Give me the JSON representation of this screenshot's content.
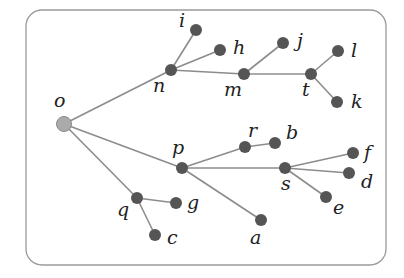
{
  "diagram": {
    "type": "tree",
    "root": "o",
    "nodes": [
      {
        "id": "o",
        "label": "o",
        "x": 64,
        "y": 124,
        "lx": 54,
        "ly": 107,
        "root": true
      },
      {
        "id": "n",
        "label": "n",
        "x": 171,
        "y": 70,
        "lx": 153,
        "ly": 92
      },
      {
        "id": "i",
        "label": "i",
        "x": 196,
        "y": 30,
        "lx": 179,
        "ly": 27
      },
      {
        "id": "h",
        "label": "h",
        "x": 220,
        "y": 50,
        "lx": 233,
        "ly": 54
      },
      {
        "id": "m",
        "label": "m",
        "x": 244,
        "y": 74,
        "lx": 224,
        "ly": 96
      },
      {
        "id": "j",
        "label": "j",
        "x": 283,
        "y": 43,
        "lx": 297,
        "ly": 47
      },
      {
        "id": "t",
        "label": "t",
        "x": 311,
        "y": 74,
        "lx": 302,
        "ly": 96
      },
      {
        "id": "l",
        "label": "l",
        "x": 338,
        "y": 51,
        "lx": 351,
        "ly": 57
      },
      {
        "id": "k",
        "label": "k",
        "x": 337,
        "y": 102,
        "lx": 351,
        "ly": 108
      },
      {
        "id": "p",
        "label": "p",
        "x": 182,
        "y": 168,
        "lx": 172,
        "ly": 154
      },
      {
        "id": "r",
        "label": "r",
        "x": 245,
        "y": 147,
        "lx": 248,
        "ly": 137
      },
      {
        "id": "b",
        "label": "b",
        "x": 275,
        "y": 143,
        "lx": 286,
        "ly": 139
      },
      {
        "id": "s",
        "label": "s",
        "x": 285,
        "y": 168,
        "lx": 281,
        "ly": 190
      },
      {
        "id": "f",
        "label": "f",
        "x": 353,
        "y": 153,
        "lx": 364,
        "ly": 159
      },
      {
        "id": "d",
        "label": "d",
        "x": 349,
        "y": 173,
        "lx": 361,
        "ly": 188
      },
      {
        "id": "e",
        "label": "e",
        "x": 326,
        "y": 197,
        "lx": 333,
        "ly": 214
      },
      {
        "id": "a",
        "label": "a",
        "x": 261,
        "y": 220,
        "lx": 250,
        "ly": 244
      },
      {
        "id": "q",
        "label": "q",
        "x": 137,
        "y": 198,
        "lx": 117,
        "ly": 216
      },
      {
        "id": "g",
        "label": "g",
        "x": 176,
        "y": 203,
        "lx": 187,
        "ly": 209
      },
      {
        "id": "c",
        "label": "c",
        "x": 155,
        "y": 235,
        "lx": 167,
        "ly": 244
      }
    ],
    "edges": [
      [
        "o",
        "n"
      ],
      [
        "o",
        "p"
      ],
      [
        "o",
        "q"
      ],
      [
        "n",
        "i"
      ],
      [
        "n",
        "h"
      ],
      [
        "n",
        "m"
      ],
      [
        "m",
        "j"
      ],
      [
        "m",
        "t"
      ],
      [
        "t",
        "l"
      ],
      [
        "t",
        "k"
      ],
      [
        "p",
        "r"
      ],
      [
        "p",
        "s"
      ],
      [
        "p",
        "a"
      ],
      [
        "r",
        "b"
      ],
      [
        "s",
        "f"
      ],
      [
        "s",
        "d"
      ],
      [
        "s",
        "e"
      ],
      [
        "q",
        "g"
      ],
      [
        "q",
        "c"
      ]
    ],
    "frame": {
      "x": 26,
      "y": 10,
      "width": 360,
      "height": 255,
      "radius": 16
    }
  },
  "colors": {
    "node": "#555555",
    "root": "#ababab",
    "edge": "#8c8c8c",
    "frame": "#9a9a9a",
    "label": "#222222"
  }
}
